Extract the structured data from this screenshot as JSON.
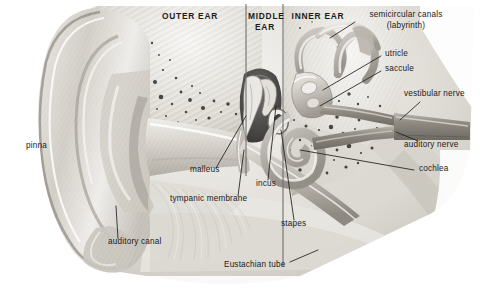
{
  "figure": {
    "style": "grayscale pencil / airbrush medical illustration",
    "background_color": "#ffffff",
    "ink_color": "#1b1b1b"
  },
  "region_labels": [
    {
      "id": "outer-ear",
      "text": "OUTER EAR",
      "x": 190,
      "y": 16,
      "lines": [
        "OUTER EAR"
      ]
    },
    {
      "id": "middle-ear",
      "text": "MIDDLE EAR",
      "x": 264,
      "y": 16,
      "lines": [
        "MIDDLE",
        "EAR"
      ]
    },
    {
      "id": "inner-ear",
      "text": "INNER EAR",
      "x": 318,
      "y": 16,
      "lines": [
        "INNER EAR"
      ]
    }
  ],
  "part_labels": [
    {
      "id": "semicircular-canals",
      "line1": "semicircular canals",
      "line2": "(labyrinth)",
      "x": 358,
      "y": 14
    },
    {
      "id": "utricle",
      "line1": "utricle",
      "line2": "",
      "x": 385,
      "y": 53
    },
    {
      "id": "saccule",
      "line1": "saccule",
      "line2": "",
      "x": 385,
      "y": 68
    },
    {
      "id": "vestibular-nerve",
      "line1": "vestibular nerve",
      "line2": "",
      "x": 404,
      "y": 93
    },
    {
      "id": "auditory-nerve",
      "line1": "auditory nerve",
      "line2": "",
      "x": 404,
      "y": 144
    },
    {
      "id": "cochlea",
      "line1": "cochlea",
      "line2": "",
      "x": 418,
      "y": 167
    },
    {
      "id": "pinna",
      "line1": "pinna",
      "line2": "",
      "x": 26,
      "y": 145
    },
    {
      "id": "malleus",
      "line1": "malleus",
      "line2": "",
      "x": 190,
      "y": 169
    },
    {
      "id": "incus",
      "line1": "incus",
      "line2": "",
      "x": 256,
      "y": 183
    },
    {
      "id": "tympanic-membrane",
      "line1": "tympanic membrane",
      "line2": "",
      "x": 170,
      "y": 197
    },
    {
      "id": "stapes",
      "line1": "stapes",
      "line2": "",
      "x": 281,
      "y": 223
    },
    {
      "id": "auditory-canal",
      "line1": "auditory canal",
      "line2": "",
      "x": 108,
      "y": 241
    },
    {
      "id": "eustachian-tube",
      "line1": "Eustachian tube",
      "line2": "",
      "x": 224,
      "y": 264
    }
  ],
  "colors": {
    "ink": "#1b1b1b",
    "leader": "#20201f",
    "divider": "#6f6f6f",
    "bone_light": "#e9e7e3",
    "bone_mid": "#cfccc6",
    "bone_dark": "#a6a29b",
    "cavity_dark": "#4a4a49",
    "nerve": "#9b978f",
    "skin_light": "#dedbd5",
    "skin_shadow": "#b3aea6"
  }
}
